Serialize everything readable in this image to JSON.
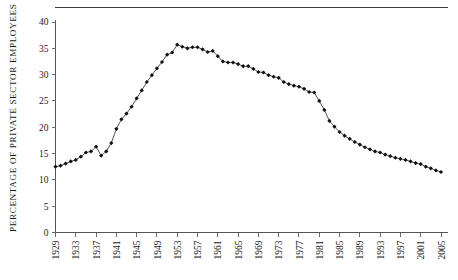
{
  "chart_data": {
    "type": "line",
    "title": "",
    "xlabel": "",
    "ylabel": "PERCENTAGE OF PRIVATE SECTOR EMPLOYEES",
    "ylim": [
      0,
      40
    ],
    "xlim": [
      1929,
      2005
    ],
    "grid": false,
    "legend": null,
    "yticks": [
      0,
      5,
      10,
      15,
      20,
      25,
      30,
      35,
      40
    ],
    "ytick_labels": [
      "0",
      "5",
      "10",
      "15",
      "20",
      "25",
      "30",
      "35",
      "40"
    ],
    "xticks": [
      1929,
      1933,
      1937,
      1941,
      1945,
      1949,
      1953,
      1957,
      1961,
      1965,
      1969,
      1973,
      1977,
      1981,
      1985,
      1989,
      1993,
      1997,
      2001,
      2005
    ],
    "xtick_labels": [
      "1929",
      "1933",
      "1937",
      "1941",
      "1945",
      "1949",
      "1953",
      "1957",
      "1961",
      "1965",
      "1969",
      "1973",
      "1977",
      "1981",
      "1985",
      "1989",
      "1993",
      "1997",
      "2001",
      "2005"
    ],
    "marker": "filled-diamond",
    "line_color": "#2a2a2a",
    "marker_color": "#111111",
    "x": [
      1929,
      1930,
      1931,
      1932,
      1933,
      1934,
      1935,
      1936,
      1937,
      1938,
      1939,
      1940,
      1941,
      1942,
      1943,
      1944,
      1945,
      1946,
      1947,
      1948,
      1949,
      1950,
      1951,
      1952,
      1953,
      1954,
      1955,
      1956,
      1957,
      1958,
      1959,
      1960,
      1961,
      1962,
      1963,
      1964,
      1965,
      1966,
      1967,
      1968,
      1969,
      1970,
      1971,
      1972,
      1973,
      1974,
      1975,
      1976,
      1977,
      1978,
      1979,
      1980,
      1981,
      1982,
      1983,
      1984,
      1985,
      1986,
      1987,
      1988,
      1989,
      1990,
      1991,
      1992,
      1993,
      1994,
      1995,
      1996,
      1997,
      1998,
      1999,
      2000,
      2001,
      2002,
      2003,
      2004,
      2005
    ],
    "values": [
      12.5,
      12.7,
      13.1,
      13.5,
      13.8,
      14.4,
      15.2,
      15.4,
      16.3,
      14.6,
      15.4,
      17.0,
      19.7,
      21.5,
      22.6,
      23.9,
      25.5,
      27.0,
      28.6,
      29.9,
      31.2,
      32.4,
      33.8,
      34.2,
      35.7,
      35.3,
      35.0,
      35.2,
      35.2,
      34.8,
      34.3,
      34.5,
      33.5,
      32.5,
      32.3,
      32.3,
      32.0,
      31.6,
      31.6,
      31.1,
      30.5,
      30.4,
      29.9,
      29.6,
      29.4,
      28.6,
      28.2,
      27.9,
      27.7,
      27.3,
      26.7,
      26.6,
      25.0,
      23.3,
      21.2,
      20.1,
      19.1,
      18.4,
      17.8,
      17.2,
      16.7,
      16.2,
      15.8,
      15.4,
      15.2,
      14.8,
      14.5,
      14.2,
      14.0,
      13.8,
      13.5,
      13.2,
      13.0,
      12.5,
      12.2,
      11.8,
      11.5
    ],
    "note_source_visible": false
  },
  "axis_titles": {
    "y_axis_label": "PERCENTAGE OF PRIVATE SECTOR EMPLOYEES"
  }
}
